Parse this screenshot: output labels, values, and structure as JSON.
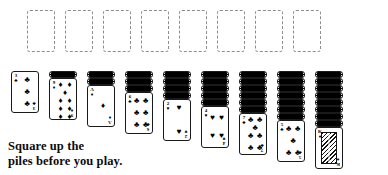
{
  "figure": {
    "caption_line1": "Square up the",
    "caption_line2": "piles before you play.",
    "game": "Klondike / Spider solitaire layout"
  },
  "suits": {
    "spade": "♠",
    "heart": "♥",
    "diamond": "♦",
    "club": "♣"
  },
  "foundations": {
    "count": 8,
    "slots": [
      {
        "label": "",
        "index": 1
      },
      {
        "label": "",
        "index": 2
      },
      {
        "label": "",
        "index": 3
      },
      {
        "label": "",
        "index": 4
      },
      {
        "label": "",
        "index": 5
      },
      {
        "label": "",
        "index": 6
      },
      {
        "label": "",
        "index": 7
      },
      {
        "label": "",
        "index": 8
      }
    ]
  },
  "tableau": {
    "column_count": 9,
    "columns": [
      {
        "index": 1,
        "facedown": 0,
        "rank": "3",
        "suit": "♣",
        "suit_name": "club",
        "color": "#000000",
        "pips": 3
      },
      {
        "index": 2,
        "facedown": 1,
        "rank": "9",
        "suit": "♦",
        "suit_name": "diamond",
        "color": "#000000",
        "pips": 9
      },
      {
        "index": 3,
        "facedown": 2,
        "rank": "A",
        "suit": "♦",
        "suit_name": "diamond",
        "color": "#000000",
        "pips": 1
      },
      {
        "index": 4,
        "facedown": 3,
        "rank": "6",
        "suit": "♣",
        "suit_name": "club",
        "color": "#000000",
        "pips": 6
      },
      {
        "index": 5,
        "facedown": 4,
        "rank": "2",
        "suit": "♥",
        "suit_name": "heart",
        "color": "#000000",
        "pips": 2
      },
      {
        "index": 6,
        "facedown": 5,
        "rank": "4",
        "suit": "♥",
        "suit_name": "heart",
        "color": "#000000",
        "pips": 4
      },
      {
        "index": 7,
        "facedown": 6,
        "rank": "7",
        "suit": "♣",
        "suit_name": "club",
        "color": "#000000",
        "pips": 7
      },
      {
        "index": 8,
        "facedown": 7,
        "rank": "5",
        "suit": "♣",
        "suit_name": "club",
        "color": "#000000",
        "pips": 5
      },
      {
        "index": 9,
        "facedown": 8,
        "rank": "K",
        "suit": "♠",
        "suit_name": "spade",
        "color": "#000000",
        "pips": 0,
        "court": true
      }
    ]
  },
  "layout": {
    "card_width": 28,
    "card_height": 42,
    "column_pitch": 38,
    "first_column_x": 11,
    "foundation_x": 27,
    "foundation_y": 10,
    "foundation_pitch": 38,
    "tableau_top": 71,
    "facedown_step": 7
  },
  "colors": {
    "card_border": "#1a1a1a",
    "placeholder_border": "#8d8d8d",
    "background": "#ffffff",
    "ink": "#000000"
  }
}
